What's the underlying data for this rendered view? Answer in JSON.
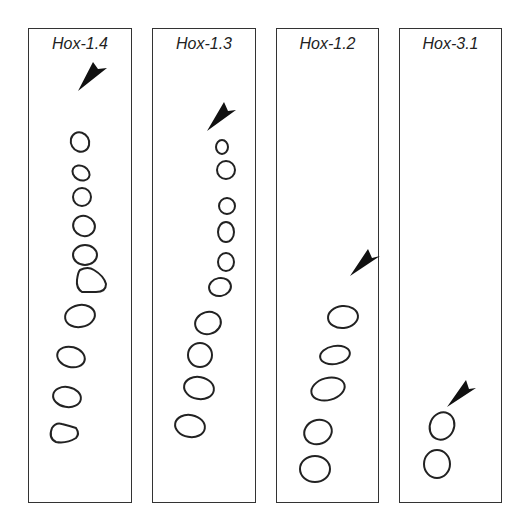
{
  "panels": [
    {
      "label": "Hox-1.4",
      "left": 28,
      "width": 104
    },
    {
      "label": "Hox-1.3",
      "left": 152,
      "width": 104
    },
    {
      "label": "Hox-1.2",
      "left": 276,
      "width": 103
    },
    {
      "label": "Hox-3.1",
      "left": 399,
      "width": 103
    }
  ],
  "colors": {
    "stroke": "#222222",
    "border": "#333333",
    "background": "#ffffff"
  }
}
